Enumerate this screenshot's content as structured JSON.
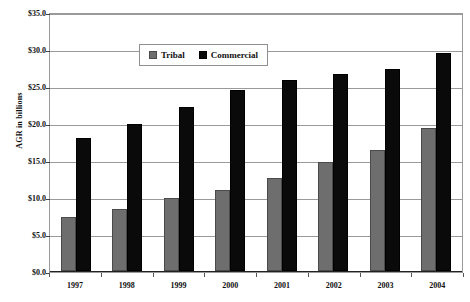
{
  "chart_data": {
    "type": "bar",
    "title": "",
    "xlabel": "",
    "ylabel": "AGR in billions",
    "categories": [
      "1997",
      "1998",
      "1999",
      "2000",
      "2001",
      "2002",
      "2003",
      "2004"
    ],
    "series": [
      {
        "name": "Tribal",
        "color": "#6e6e6e",
        "values": [
          7.3,
          8.4,
          9.8,
          11.0,
          12.6,
          14.7,
          16.4,
          19.3
        ]
      },
      {
        "name": "Commercial",
        "color": "#0a0a0a",
        "values": [
          18.0,
          19.8,
          22.1,
          24.4,
          25.8,
          26.6,
          27.3,
          29.4
        ]
      }
    ],
    "ylim": [
      0,
      35
    ],
    "ytick_values": [
      0,
      5,
      10,
      15,
      20,
      25,
      30,
      35
    ],
    "ytick_labels": [
      "$0.0",
      "$5.0",
      "$10.0",
      "$15.0",
      "$20.0",
      "$25.0",
      "$30.0",
      "$35.0"
    ],
    "grid": true,
    "legend_position": "top-center"
  },
  "legend": {
    "items": [
      {
        "label": "Tribal",
        "swatch": "gray-square-icon"
      },
      {
        "label": "Commercial",
        "swatch": "black-square-icon"
      }
    ]
  },
  "axis": {
    "y_title": "AGR in billions"
  }
}
